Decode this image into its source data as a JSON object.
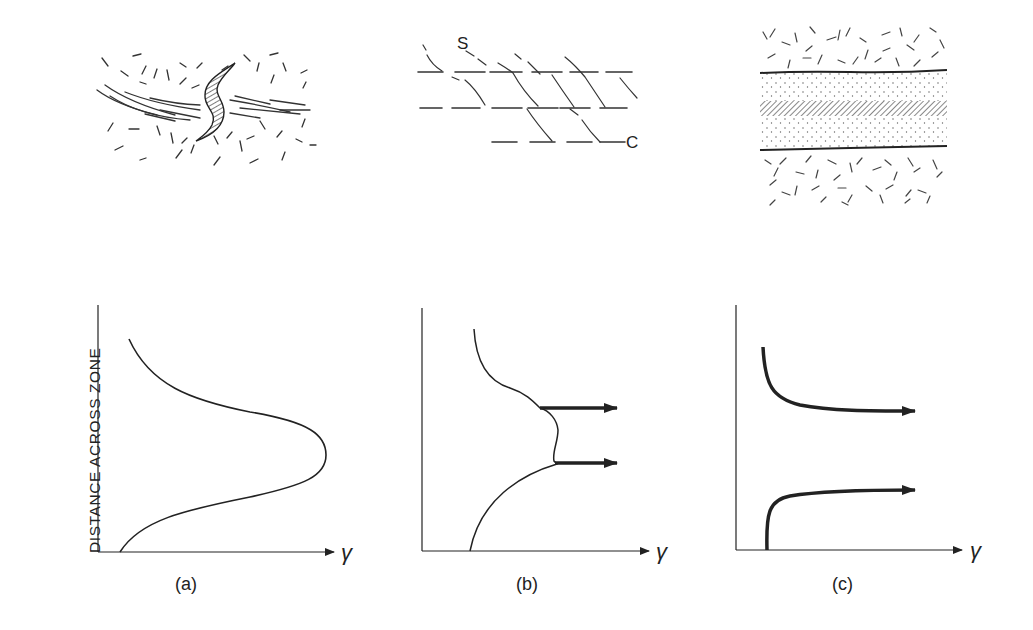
{
  "figure": {
    "y_axis_label": "DISTANCE ACROSS ZONE",
    "x_axis_symbol": "γ",
    "panels": [
      {
        "id": "a",
        "caption": "(a)",
        "description": "Single shear zone with sigmoidal marker; strain profile bell-shaped peak"
      },
      {
        "id": "b",
        "caption": "(b)",
        "description": "S-C fabric; profile with two localized high-strain bands (arrows)",
        "labels": {
          "s": "S",
          "c": "C"
        }
      },
      {
        "id": "c",
        "caption": "(c)",
        "description": "Zone with discrete margins, strain localized to boundaries (arrows)"
      }
    ]
  },
  "colors": {
    "ink": "#222222",
    "background": "#ffffff"
  }
}
